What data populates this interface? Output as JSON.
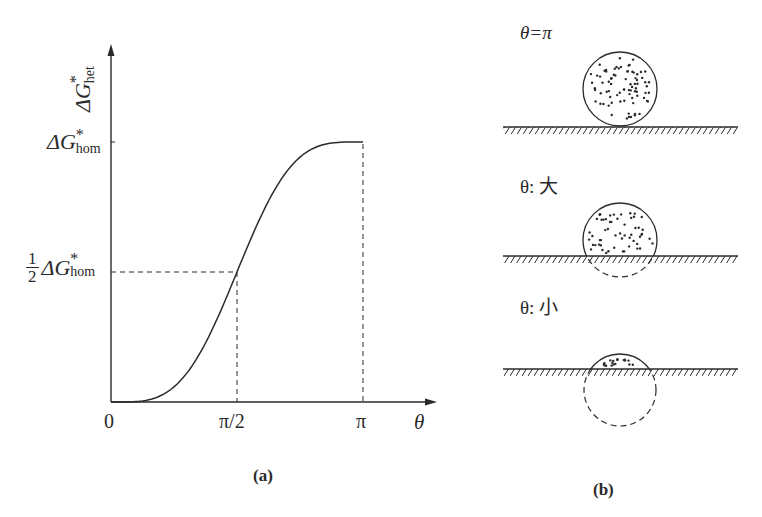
{
  "chart_data": {
    "type": "line",
    "title": "",
    "xlabel": "θ",
    "ylabel": "ΔG*het",
    "xlim": [
      0,
      3.14159
    ],
    "ylim": [
      0,
      1.0
    ],
    "x_ticks": [
      {
        "value": 0,
        "label": "0"
      },
      {
        "value": 1.5708,
        "label": "π/2"
      },
      {
        "value": 3.14159,
        "label": "π"
      }
    ],
    "y_ticks": [
      {
        "value": 0.5,
        "label": "½ ΔG*hom"
      },
      {
        "value": 1.0,
        "label": "ΔG*hom"
      }
    ],
    "series": [
      {
        "name": "ΔG*het / ΔG*hom = (2 − 3cosθ + cos³θ)/4",
        "x": [
          0,
          0.3927,
          0.7854,
          1.1781,
          1.5708,
          1.9635,
          2.3562,
          2.7489,
          3.14159
        ],
        "values": [
          0,
          0.004,
          0.058,
          0.227,
          0.5,
          0.773,
          0.942,
          0.996,
          1.0
        ]
      }
    ],
    "reference_lines": [
      {
        "type": "dashed",
        "from": [
          0,
          0.5
        ],
        "to": [
          1.5708,
          0.5
        ]
      },
      {
        "type": "dashed",
        "from": [
          1.5708,
          0
        ],
        "to": [
          1.5708,
          0.5
        ]
      },
      {
        "type": "dashed",
        "from": [
          3.14159,
          0
        ],
        "to": [
          3.14159,
          1.0
        ]
      }
    ],
    "grid": false,
    "legend": "none"
  },
  "panel_a": {
    "caption": "(a)",
    "y_axis_label": {
      "main": "ΔG",
      "sup": "*",
      "sub": "het"
    },
    "y_tick_top": {
      "main": "ΔG",
      "sup": "*",
      "sub": "hom"
    },
    "y_tick_half": {
      "num": "1",
      "den": "2",
      "main": "ΔG",
      "sup": "*",
      "sub": "hom"
    },
    "x_tick_0": "0",
    "x_tick_half": "π/2",
    "x_tick_pi": "π",
    "x_axis_label": "θ"
  },
  "panel_b": {
    "caption": "(b)",
    "diagrams": [
      {
        "label": "θ=π",
        "shape": "full-sphere"
      },
      {
        "label": "θ: 大",
        "shape": "large-cap"
      },
      {
        "label": "θ: 小",
        "shape": "small-cap"
      }
    ]
  },
  "colors": {
    "ink": "#2a2a2a",
    "background": "#ffffff"
  }
}
